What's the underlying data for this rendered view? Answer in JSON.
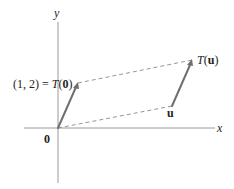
{
  "diagram": {
    "axes": {
      "x_label": "x",
      "y_label": "y",
      "origin_label": "0"
    },
    "points": {
      "origin": {
        "label": "0",
        "coords": [
          0,
          0
        ]
      },
      "T0": {
        "label_prefix": "(1, 2) = ",
        "label_func": "T",
        "label_arg": "0",
        "coords": [
          1,
          2
        ]
      },
      "u": {
        "label": "u",
        "coords": [
          5.7,
          1.1
        ]
      },
      "Tu": {
        "label_func": "T",
        "label_arg": "u",
        "coords": [
          6.7,
          3.1
        ]
      }
    },
    "vectors": [
      {
        "name": "translation-vector-origin",
        "from": "origin",
        "to": "T0"
      },
      {
        "name": "translation-vector-u",
        "from": "u",
        "to": "Tu"
      }
    ],
    "dashed_segments": [
      {
        "name": "dashed-origin-to-u",
        "from": "origin",
        "to": "u"
      },
      {
        "name": "dashed-T0-to-Tu",
        "from": "T0",
        "to": "Tu"
      }
    ],
    "colors": {
      "axis": "#9a9a9a",
      "vector": "#6f6f6f",
      "dash": "#8a8a8a",
      "text": "#222222"
    }
  }
}
